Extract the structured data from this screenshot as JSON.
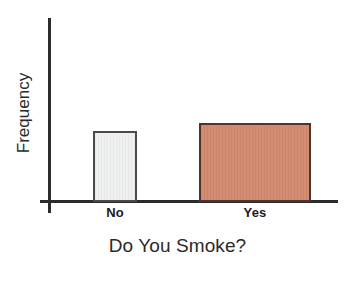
{
  "chart_data": {
    "type": "bar",
    "title": "",
    "subtitle": "",
    "xlabel": "Do You Smoke?",
    "ylabel": "Frequency",
    "categories": [
      "No",
      "Yes"
    ],
    "values": [
      71,
      79
    ],
    "series": [
      {
        "name": "Frequency",
        "values": [
          71,
          79
        ]
      }
    ],
    "bars": [
      {
        "category": "No",
        "value": 71,
        "fill_color": "#eef1f0",
        "border_color": "#4a4a4a"
      },
      {
        "category": "Yes",
        "value": 79,
        "fill_color": "#d08a6e",
        "border_color": "#51332a"
      }
    ],
    "ylim": [
      0,
      100
    ],
    "y_tick_labels": [],
    "grid": false,
    "legend": false,
    "legend_position": "none",
    "annotations": [],
    "axis_color": "#2b2b2b",
    "background_color": "#ffffff"
  },
  "figure": {
    "x_axis_title": "Do You Smoke?",
    "y_axis_title": "Frequency",
    "tick_no": "No",
    "tick_yes": "Yes"
  }
}
